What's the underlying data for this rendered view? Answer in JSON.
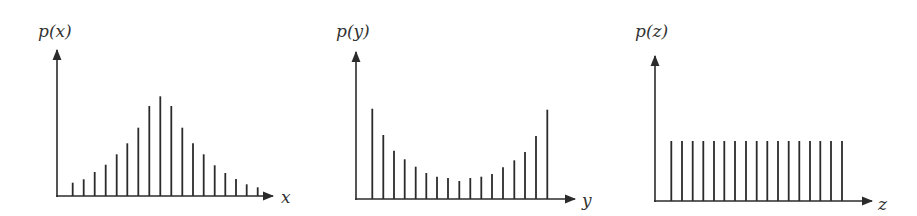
{
  "colors": {
    "ink": "#2b2b2b",
    "background": "#ffffff"
  },
  "chart_data": [
    {
      "type": "bar",
      "style": "stem",
      "title": "",
      "ylabel": "p(x)",
      "xlabel": "x",
      "grid": false,
      "legend": null,
      "description": "Bell-shaped (unimodal, symmetric) discrete distribution",
      "origin": {
        "x": 57,
        "y": 196
      },
      "y_axis_top": 50,
      "x_axis_end": 273,
      "x": [
        72.7,
        83.7,
        94.7,
        105.7,
        116.7,
        127.3,
        138.3,
        149.3,
        160.3,
        171.3,
        182.3,
        193.0,
        203.7,
        214.7,
        225.3,
        236.0,
        246.7,
        257.7
      ],
      "values": [
        13.3,
        16.7,
        24.0,
        31.3,
        41.7,
        52.7,
        68.3,
        90.0,
        99.7,
        90.0,
        68.3,
        52.7,
        41.7,
        30.7,
        23.0,
        17.0,
        11.7,
        8.7
      ],
      "label_pos": {
        "ylabel": [
          38,
          37
        ],
        "xlabel": [
          281,
          203
        ]
      }
    },
    {
      "type": "bar",
      "style": "stem",
      "title": "",
      "ylabel": "p(y)",
      "xlabel": "y",
      "grid": false,
      "legend": null,
      "description": "U-shaped (bimodal at extremes) discrete distribution",
      "origin": {
        "x": 356,
        "y": 199
      },
      "y_axis_top": 52,
      "x_axis_end": 575,
      "x": [
        372.3,
        383.3,
        394.0,
        404.7,
        415.7,
        426.3,
        437.0,
        448.0,
        459.3,
        470.3,
        481.3,
        492.0,
        503.0,
        514.3,
        525.0,
        536.0,
        547.3
      ],
      "values": [
        90.3,
        64.0,
        48.3,
        39.7,
        32.3,
        26.0,
        22.3,
        21.0,
        18.0,
        21.0,
        22.3,
        25.0,
        31.7,
        38.7,
        47.0,
        63.0,
        89.3
      ],
      "label_pos": {
        "ylabel": [
          336,
          37
        ],
        "xlabel": [
          582,
          206
        ]
      }
    },
    {
      "type": "bar",
      "style": "stem",
      "title": "",
      "ylabel": "p(z)",
      "xlabel": "z",
      "grid": false,
      "legend": null,
      "description": "Uniform discrete distribution",
      "origin": {
        "x": 655,
        "y": 201
      },
      "y_axis_top": 56,
      "x_axis_end": 872,
      "x": [
        671.3,
        682.0,
        692.7,
        703.3,
        714.0,
        724.3,
        735.0,
        746.0,
        756.7,
        767.3,
        778.0,
        788.7,
        799.3,
        810.0,
        820.3,
        831.0,
        842.0
      ],
      "values": [
        60,
        60,
        60,
        60,
        60,
        60,
        60,
        60,
        60,
        60,
        60,
        60,
        60,
        60,
        60,
        60,
        60
      ],
      "label_pos": {
        "ylabel": [
          635,
          37
        ],
        "xlabel": [
          878,
          210
        ]
      }
    }
  ]
}
